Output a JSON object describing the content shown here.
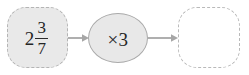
{
  "diagram": {
    "type": "function-machine",
    "title": "",
    "nodes": [
      {
        "id": "input-box",
        "role": "input-value",
        "value_text": "2 3/7",
        "whole": "2",
        "numerator": "3",
        "denominator": "7",
        "shape": "rounded-square-dashed",
        "fill_color": "#e9e9e9",
        "border_color": "#b4b4b4"
      },
      {
        "id": "operator-oval",
        "role": "operation",
        "value_text": "×3",
        "shape": "ellipse",
        "fill_color": "#e8e8e8",
        "border_color": "#a9a9a9"
      },
      {
        "id": "output-box",
        "role": "answer-blank",
        "value_text": "",
        "shape": "rounded-square-dashed",
        "fill_color": "#ffffff",
        "border_color": "#b9b9b9"
      }
    ],
    "arrows": [
      {
        "id": "arrow-1",
        "from": "input-box",
        "to": "operator-oval",
        "color": "#a6a6a6"
      },
      {
        "id": "arrow-2",
        "from": "operator-oval",
        "to": "output-box",
        "color": "#a6a6a6"
      }
    ],
    "colors": {
      "background": "#ffffff",
      "text": "#262626",
      "arrow": "#a6a6a6"
    }
  }
}
